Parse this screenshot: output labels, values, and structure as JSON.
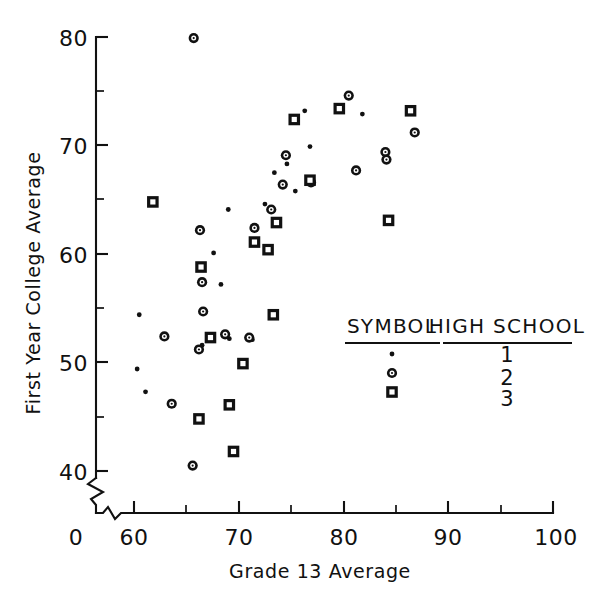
{
  "chart_data": {
    "type": "scatter",
    "title": "",
    "xlabel": "Grade 13 Average",
    "ylabel": "First Year College Average",
    "xlim": [
      58.5,
      100
    ],
    "ylim": [
      38.5,
      80.5
    ],
    "x_ticks": [
      60,
      70,
      80,
      90,
      100
    ],
    "x_ticks_minor": [
      65,
      75,
      85,
      95
    ],
    "x_origin_label": "0",
    "y_ticks": [
      40,
      50,
      60,
      70,
      80
    ],
    "y_ticks_minor": [
      45,
      55,
      65,
      75
    ],
    "grid": false,
    "axis_break_x": true,
    "axis_break_y": true,
    "legend_position": "inside-lower-right",
    "series": [
      {
        "name": "High School 1",
        "symbol": "dot",
        "points": [
          [
            60.5,
            54.4
          ],
          [
            60.3,
            49.4
          ],
          [
            61.1,
            47.3
          ],
          [
            66.5,
            51.6
          ],
          [
            67.6,
            60.1
          ],
          [
            68.3,
            57.2
          ],
          [
            69.0,
            64.1
          ],
          [
            69.1,
            52.2
          ],
          [
            70.5,
            50.2
          ],
          [
            71.6,
            61.0
          ],
          [
            71.3,
            52.1
          ],
          [
            72.5,
            64.6
          ],
          [
            73.4,
            67.5
          ],
          [
            74.6,
            68.3
          ],
          [
            75.4,
            65.8
          ],
          [
            76.3,
            73.2
          ],
          [
            76.8,
            69.9
          ],
          [
            81.8,
            72.9
          ]
        ]
      },
      {
        "name": "High School 2",
        "symbol": "circle",
        "points": [
          [
            65.7,
            79.9
          ],
          [
            62.9,
            52.4
          ],
          [
            63.6,
            46.2
          ],
          [
            65.6,
            40.5
          ],
          [
            66.3,
            62.2
          ],
          [
            66.5,
            57.4
          ],
          [
            66.6,
            54.7
          ],
          [
            66.2,
            51.2
          ],
          [
            68.7,
            52.6
          ],
          [
            71.0,
            52.3
          ],
          [
            71.5,
            62.4
          ],
          [
            73.1,
            64.1
          ],
          [
            74.2,
            66.4
          ],
          [
            74.5,
            69.1
          ],
          [
            76.9,
            66.6
          ],
          [
            80.5,
            74.6
          ],
          [
            81.2,
            67.7
          ],
          [
            84.0,
            69.4
          ],
          [
            84.1,
            68.7
          ],
          [
            86.8,
            71.2
          ]
        ]
      },
      {
        "name": "High School 3",
        "symbol": "square",
        "points": [
          [
            61.8,
            64.8
          ],
          [
            66.4,
            58.8
          ],
          [
            66.2,
            44.8
          ],
          [
            67.3,
            52.3
          ],
          [
            69.1,
            46.1
          ],
          [
            69.5,
            41.8
          ],
          [
            70.4,
            49.9
          ],
          [
            71.5,
            61.1
          ],
          [
            72.8,
            60.4
          ],
          [
            73.3,
            54.4
          ],
          [
            73.6,
            62.9
          ],
          [
            75.3,
            72.4
          ],
          [
            76.8,
            66.8
          ],
          [
            79.6,
            73.4
          ],
          [
            84.3,
            63.1
          ],
          [
            86.4,
            73.2
          ]
        ]
      }
    ]
  },
  "legend": {
    "symbol_header": "SYMBOL",
    "school_header": "HIGH  SCHOOL",
    "rows": [
      {
        "symbol": "dot",
        "school": "1"
      },
      {
        "symbol": "circle",
        "school": "2"
      },
      {
        "symbol": "square",
        "school": "3"
      }
    ]
  },
  "axis_text": {
    "x_label": "Grade 13 Average",
    "y_label": "First Year College Average",
    "x_tick_0": "0",
    "x_tick_60": "60",
    "x_tick_70": "70",
    "x_tick_80": "80",
    "x_tick_90": "90",
    "x_tick_100": "100",
    "y_tick_40": "40",
    "y_tick_50": "50",
    "y_tick_60": "60",
    "y_tick_70": "70",
    "y_tick_80": "80"
  },
  "colors": {
    "ink": "#111111",
    "paper": "#ffffff"
  }
}
